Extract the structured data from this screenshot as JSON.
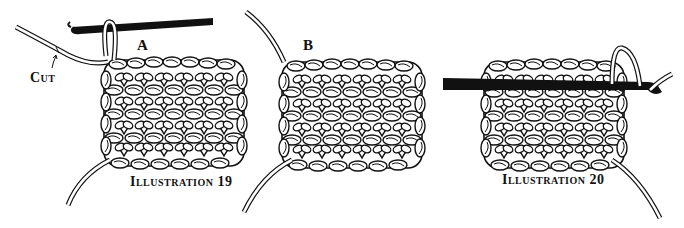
{
  "figure": {
    "panel_a": {
      "letter": "A",
      "cut_label": "Cut",
      "caption": "Illustration 19"
    },
    "panel_b": {
      "letter": "B"
    },
    "panel_20": {
      "caption": "Illustration 20"
    }
  },
  "colors": {
    "ink": "#111111",
    "paper": "#ffffff"
  }
}
